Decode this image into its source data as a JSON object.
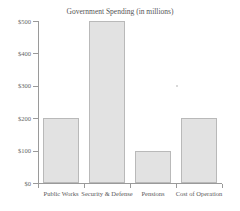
{
  "chart_data": {
    "type": "bar",
    "title": "Government Spending (in millions)",
    "xlabel": "",
    "ylabel": "",
    "categories": [
      "Public Works",
      "Security & Defense",
      "Pensions",
      "Cost of Operation"
    ],
    "values": [
      200,
      500,
      100,
      200
    ],
    "ytick_labels": [
      "$0",
      "$100",
      "$200",
      "$300",
      "$400",
      "$500"
    ],
    "ytick_values": [
      0,
      100,
      200,
      300,
      400,
      500
    ],
    "ylim": [
      0,
      500
    ],
    "grid": false,
    "legend": "none",
    "bar_fill_color": "#e2e2e2",
    "bar_edge_color": "#b9b9b9",
    "axis_color": "#9a9a9a"
  },
  "artifacts": {
    "top_clipped_text": "",
    "speck_note": "scan-speck"
  }
}
